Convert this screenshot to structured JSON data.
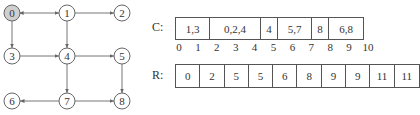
{
  "graph": {
    "nodes": [
      {
        "id": "0",
        "x": 12,
        "y": 13,
        "highlighted": true
      },
      {
        "id": "1",
        "x": 67,
        "y": 13,
        "highlighted": false
      },
      {
        "id": "2",
        "x": 122,
        "y": 13,
        "highlighted": false
      },
      {
        "id": "3",
        "x": 12,
        "y": 56,
        "highlighted": false
      },
      {
        "id": "4",
        "x": 67,
        "y": 56,
        "highlighted": false
      },
      {
        "id": "5",
        "x": 122,
        "y": 56,
        "highlighted": false
      },
      {
        "id": "6",
        "x": 12,
        "y": 101,
        "highlighted": false
      },
      {
        "id": "7",
        "x": 67,
        "y": 101,
        "highlighted": false
      },
      {
        "id": "8",
        "x": 122,
        "y": 101,
        "highlighted": false
      }
    ],
    "edges": [
      {
        "from": "0",
        "to": "1",
        "bidirectional": true
      },
      {
        "from": "1",
        "to": "2"
      },
      {
        "from": "0",
        "to": "3"
      },
      {
        "from": "1",
        "to": "4"
      },
      {
        "from": "3",
        "to": "4"
      },
      {
        "from": "4",
        "to": "5"
      },
      {
        "from": "4",
        "to": "7"
      },
      {
        "from": "5",
        "to": "8"
      },
      {
        "from": "7",
        "to": "6"
      },
      {
        "from": "7",
        "to": "8"
      }
    ],
    "colors": {
      "node_fill": "#ffffff",
      "node_highlight": "#cfcfcf",
      "stroke": "#666666"
    }
  },
  "c_array": {
    "label": "C:",
    "cells": [
      {
        "text": "1,3",
        "span": 2
      },
      {
        "text": "0,2,4",
        "span": 3
      },
      {
        "text": "4",
        "span": 1
      },
      {
        "text": "5,7",
        "span": 2
      },
      {
        "text": "8",
        "span": 1
      },
      {
        "text": "6,8",
        "span": 2
      }
    ],
    "indices": [
      "0",
      "1",
      "2",
      "3",
      "4",
      "5",
      "6",
      "7",
      "8",
      "9",
      "10"
    ]
  },
  "r_array": {
    "label": "R:",
    "cells": [
      "0",
      "2",
      "5",
      "5",
      "6",
      "8",
      "9",
      "9",
      "11",
      "11"
    ]
  }
}
